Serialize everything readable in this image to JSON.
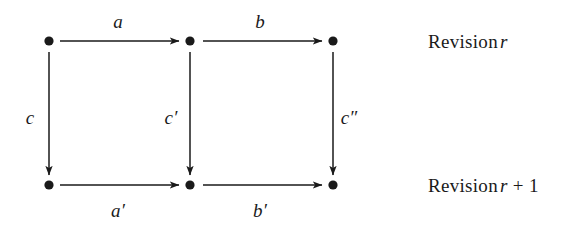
{
  "figure": {
    "kind": "commutative-diagram",
    "background_color": "#ffffff",
    "ink_color": "#1a1a1a",
    "width": 576,
    "height": 225
  },
  "nodes": [
    {
      "id": "n-top-left",
      "label": "",
      "x": 49,
      "y": 41
    },
    {
      "id": "n-top-middle",
      "label": "",
      "x": 190,
      "y": 41
    },
    {
      "id": "n-top-right",
      "label": "",
      "x": 333,
      "y": 41
    },
    {
      "id": "n-bottom-left",
      "label": "",
      "x": 49,
      "y": 185
    },
    {
      "id": "n-bottom-middle",
      "label": "",
      "x": 190,
      "y": 185
    },
    {
      "id": "n-bottom-right",
      "label": "",
      "x": 333,
      "y": 185
    }
  ],
  "edges": {
    "top_a": {
      "label": "a",
      "from": "n-top-left",
      "to": "n-top-middle",
      "label_x": 118,
      "label_y": 21
    },
    "top_b": {
      "label": "b",
      "from": "n-top-middle",
      "to": "n-top-right",
      "label_x": 260,
      "label_y": 21
    },
    "bottom_a_prime": {
      "label": "a′",
      "from": "n-bottom-left",
      "to": "n-bottom-middle",
      "label_x": 118,
      "label_y": 210
    },
    "bottom_b_prime": {
      "label": "b′",
      "from": "n-bottom-middle",
      "to": "n-bottom-right",
      "label_x": 260,
      "label_y": 210
    },
    "left_c": {
      "label": "c",
      "from": "n-top-left",
      "to": "n-bottom-left",
      "label_x": 30,
      "label_y": 117
    },
    "middle_c_prime": {
      "label": "c′",
      "from": "n-top-middle",
      "to": "n-bottom-middle",
      "label_x": 171,
      "label_y": 117
    },
    "right_c_double_prime": {
      "label": "c″",
      "from": "n-top-right",
      "to": "n-bottom-right",
      "label_x": 349,
      "label_y": 117
    }
  },
  "row_labels": {
    "top": {
      "prefix": "Revision",
      "variable": "r",
      "operator": "",
      "number": "",
      "x": 428,
      "y": 41
    },
    "bottom": {
      "prefix": "Revision",
      "variable": "r",
      "operator": "+",
      "number": "1",
      "x": 428,
      "y": 185
    }
  }
}
